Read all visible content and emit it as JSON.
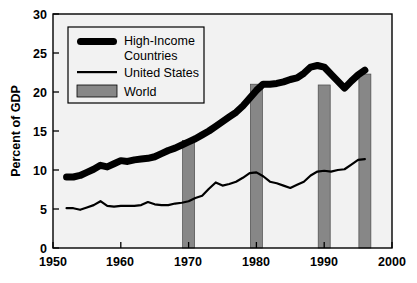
{
  "chart_data": {
    "type": "line",
    "title": "",
    "subtitle": "",
    "xlabel": "",
    "ylabel": "Percent of GDP",
    "xlim": [
      1950,
      2000
    ],
    "ylim": [
      0,
      30
    ],
    "xticks": [
      "1950",
      "1960",
      "1970",
      "1980",
      "1990",
      "2000"
    ],
    "xtick_values": [
      1950,
      1960,
      1970,
      1980,
      1990,
      2000
    ],
    "yticks": [
      "0",
      "5",
      "10",
      "15",
      "20",
      "25",
      "30"
    ],
    "ytick_values": [
      0,
      5,
      10,
      15,
      20,
      25,
      30
    ],
    "grid": false,
    "legend_position": "upper-left-inside",
    "series": [
      {
        "name": "High-Income Countries",
        "style": "thick-line",
        "color": "#000000",
        "x": [
          1952,
          1953,
          1954,
          1955,
          1956,
          1957,
          1958,
          1959,
          1960,
          1961,
          1962,
          1963,
          1964,
          1965,
          1966,
          1967,
          1968,
          1969,
          1970,
          1971,
          1972,
          1973,
          1974,
          1975,
          1976,
          1977,
          1978,
          1979,
          1980,
          1981,
          1982,
          1983,
          1984,
          1985,
          1986,
          1987,
          1988,
          1989,
          1990,
          1991,
          1992,
          1993,
          1994,
          1995,
          1996
        ],
        "values": [
          9.1,
          9.1,
          9.3,
          9.7,
          10.1,
          10.6,
          10.4,
          10.8,
          11.2,
          11.1,
          11.3,
          11.4,
          11.5,
          11.7,
          12.1,
          12.5,
          12.8,
          13.2,
          13.6,
          14.0,
          14.5,
          15.0,
          15.6,
          16.2,
          16.8,
          17.4,
          18.2,
          19.2,
          20.2,
          21.0,
          21.0,
          21.1,
          21.3,
          21.6,
          21.8,
          22.4,
          23.2,
          23.4,
          23.2,
          22.3,
          21.4,
          20.5,
          21.4,
          22.2,
          22.8
        ]
      },
      {
        "name": "United States",
        "style": "thin-line",
        "color": "#000000",
        "x": [
          1952,
          1953,
          1954,
          1955,
          1956,
          1957,
          1958,
          1959,
          1960,
          1961,
          1962,
          1963,
          1964,
          1965,
          1966,
          1967,
          1968,
          1969,
          1970,
          1971,
          1972,
          1973,
          1974,
          1975,
          1976,
          1977,
          1978,
          1979,
          1980,
          1981,
          1982,
          1983,
          1984,
          1985,
          1986,
          1987,
          1988,
          1989,
          1990,
          1991,
          1992,
          1993,
          1994,
          1995,
          1996
        ],
        "values": [
          5.1,
          5.1,
          4.9,
          5.2,
          5.5,
          6.0,
          5.4,
          5.3,
          5.4,
          5.4,
          5.4,
          5.5,
          5.9,
          5.6,
          5.5,
          5.5,
          5.7,
          5.8,
          6.0,
          6.4,
          6.7,
          7.6,
          8.4,
          8.0,
          8.2,
          8.5,
          9.0,
          9.6,
          9.7,
          9.2,
          8.5,
          8.3,
          8.0,
          7.7,
          8.1,
          8.5,
          9.3,
          9.8,
          9.9,
          9.8,
          10.0,
          10.1,
          10.7,
          11.3,
          11.4
        ]
      },
      {
        "name": "World",
        "style": "bars",
        "color": "#808080",
        "x": [
          1970,
          1980,
          1990,
          1996
        ],
        "values": [
          13.8,
          21.0,
          20.9,
          22.3
        ]
      }
    ]
  },
  "legend": {
    "entries": [
      {
        "label_line1": "High-Income",
        "label_line2": "Countries",
        "swatch": "thick-line-swatch"
      },
      {
        "label_line1": "United States",
        "label_line2": "",
        "swatch": "thin-line-swatch"
      },
      {
        "label_line1": "World",
        "label_line2": "",
        "swatch": "gray-bar-swatch"
      }
    ]
  },
  "axes": {
    "ylabel": "Percent of GDP",
    "y_tick_labels": [
      "30",
      "25",
      "20",
      "15",
      "10",
      "5",
      "0"
    ],
    "x_tick_labels": [
      "1950",
      "1960",
      "1970",
      "1980",
      "1990",
      "2000"
    ]
  },
  "colors": {
    "plot_background": "#f2f2f2",
    "bar_fill": "#878787",
    "line": "#000000",
    "axis": "#000000",
    "page_background": "#ffffff"
  }
}
